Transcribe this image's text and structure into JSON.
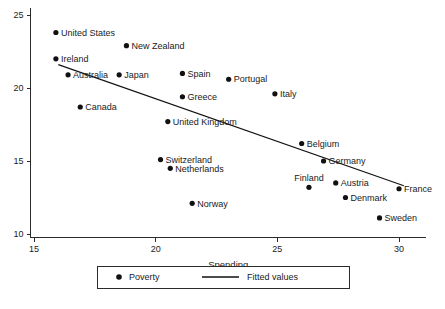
{
  "chart_data": {
    "type": "scatter",
    "title": "",
    "xlabel": "Spending",
    "ylabel": "",
    "xlim": [
      14.2,
      30.9
    ],
    "ylim": [
      9.6,
      25.4
    ],
    "xticks": [
      15,
      20,
      25,
      30
    ],
    "yticks": [
      10,
      15,
      20,
      25
    ],
    "grid": false,
    "legend_position": "bottom-center",
    "series": [
      {
        "name": "Poverty",
        "marker": "filled-circle",
        "color": "#111111",
        "points": [
          {
            "label": "United States",
            "x": 15.9,
            "y": 23.8,
            "label_side": "right"
          },
          {
            "label": "New Zealand",
            "x": 18.8,
            "y": 22.9,
            "label_side": "right"
          },
          {
            "label": "Ireland",
            "x": 15.9,
            "y": 22.0,
            "label_side": "right"
          },
          {
            "label": "Australia",
            "x": 16.4,
            "y": 20.9,
            "label_side": "right"
          },
          {
            "label": "Japan",
            "x": 18.5,
            "y": 20.9,
            "label_side": "right"
          },
          {
            "label": "Spain",
            "x": 21.1,
            "y": 21.0,
            "label_side": "right"
          },
          {
            "label": "Portugal",
            "x": 23.0,
            "y": 20.6,
            "label_side": "right"
          },
          {
            "label": "Greece",
            "x": 21.1,
            "y": 19.4,
            "label_side": "right"
          },
          {
            "label": "Italy",
            "x": 24.9,
            "y": 19.6,
            "label_side": "right"
          },
          {
            "label": "Canada",
            "x": 16.9,
            "y": 18.7,
            "label_side": "right"
          },
          {
            "label": "United Kingdom",
            "x": 20.5,
            "y": 17.7,
            "label_side": "right"
          },
          {
            "label": "Belgium",
            "x": 26.0,
            "y": 16.2,
            "label_side": "right"
          },
          {
            "label": "Germany",
            "x": 26.9,
            "y": 15.0,
            "label_side": "right"
          },
          {
            "label": "Switzerland",
            "x": 20.2,
            "y": 15.1,
            "label_side": "right"
          },
          {
            "label": "Netherlands",
            "x": 20.6,
            "y": 14.5,
            "label_side": "right"
          },
          {
            "label": "Finland",
            "x": 26.3,
            "y": 13.2,
            "label_side": "above"
          },
          {
            "label": "Austria",
            "x": 27.4,
            "y": 13.5,
            "label_side": "right"
          },
          {
            "label": "France",
            "x": 30.0,
            "y": 13.1,
            "label_side": "right"
          },
          {
            "label": "Denmark",
            "x": 27.8,
            "y": 12.5,
            "label_side": "right"
          },
          {
            "label": "Sweden",
            "x": 29.2,
            "y": 11.1,
            "label_side": "right"
          },
          {
            "label": "Norway",
            "x": 21.5,
            "y": 12.1,
            "label_side": "right"
          }
        ]
      }
    ],
    "fit_line": {
      "name": "Fitted values",
      "color": "#111111",
      "x_start": 16.0,
      "y_start": 21.6,
      "x_end": 30.2,
      "y_end": 13.3
    }
  },
  "axes": {
    "x_tick_labels": [
      "15",
      "20",
      "25",
      "30"
    ],
    "y_tick_labels": [
      "10",
      "15",
      "20",
      "25"
    ],
    "x_axis_title": "Spending"
  },
  "legend": {
    "poverty_label": "Poverty",
    "fitted_label": "Fitted values"
  }
}
